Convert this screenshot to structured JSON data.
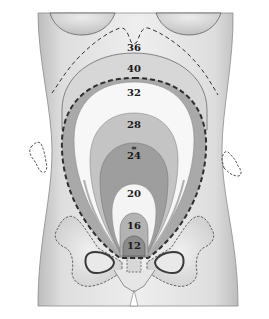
{
  "diagram": {
    "labels": {
      "w36": "36",
      "w40": "40",
      "w32": "32",
      "w28": "28",
      "w24": "24",
      "w20": "20",
      "w16": "16",
      "w12": "12"
    },
    "zones": [
      {
        "week": "12",
        "fill": "#8c8c8c"
      },
      {
        "week": "16",
        "fill": "#b3b3b3"
      },
      {
        "week": "20",
        "fill": "#f4f4f4"
      },
      {
        "week": "24",
        "fill": "#9e9e9e"
      },
      {
        "week": "28",
        "fill": "#c4c4c4"
      },
      {
        "week": "32",
        "fill": "#f7f7f7"
      },
      {
        "week": "36",
        "fill": "none",
        "style": "dashed"
      },
      {
        "week": "40",
        "fill": "#d7d7d7"
      }
    ],
    "colors": {
      "skin": "#e3e3e3",
      "skin_shadow": "#c8c8c8",
      "outer_band": "#a9a9a9",
      "outline": "#555555",
      "dash": "#333333"
    }
  }
}
